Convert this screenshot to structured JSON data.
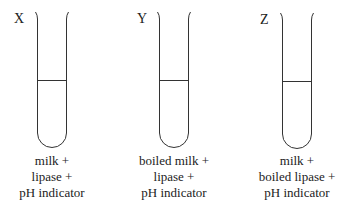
{
  "diagram": {
    "tubes": [
      {
        "id": "X",
        "label": "X",
        "contents": [
          "milk +",
          "lipase +",
          "pH indicator"
        ]
      },
      {
        "id": "Y",
        "label": "Y",
        "contents": [
          "boiled milk +",
          "lipase +",
          "pH indicator"
        ]
      },
      {
        "id": "Z",
        "label": "Z",
        "contents": [
          "milk +",
          "boiled lipase +",
          "pH indicator"
        ]
      }
    ],
    "colors": {
      "line": "#333333",
      "text": "#222222",
      "background": "#ffffff"
    }
  }
}
